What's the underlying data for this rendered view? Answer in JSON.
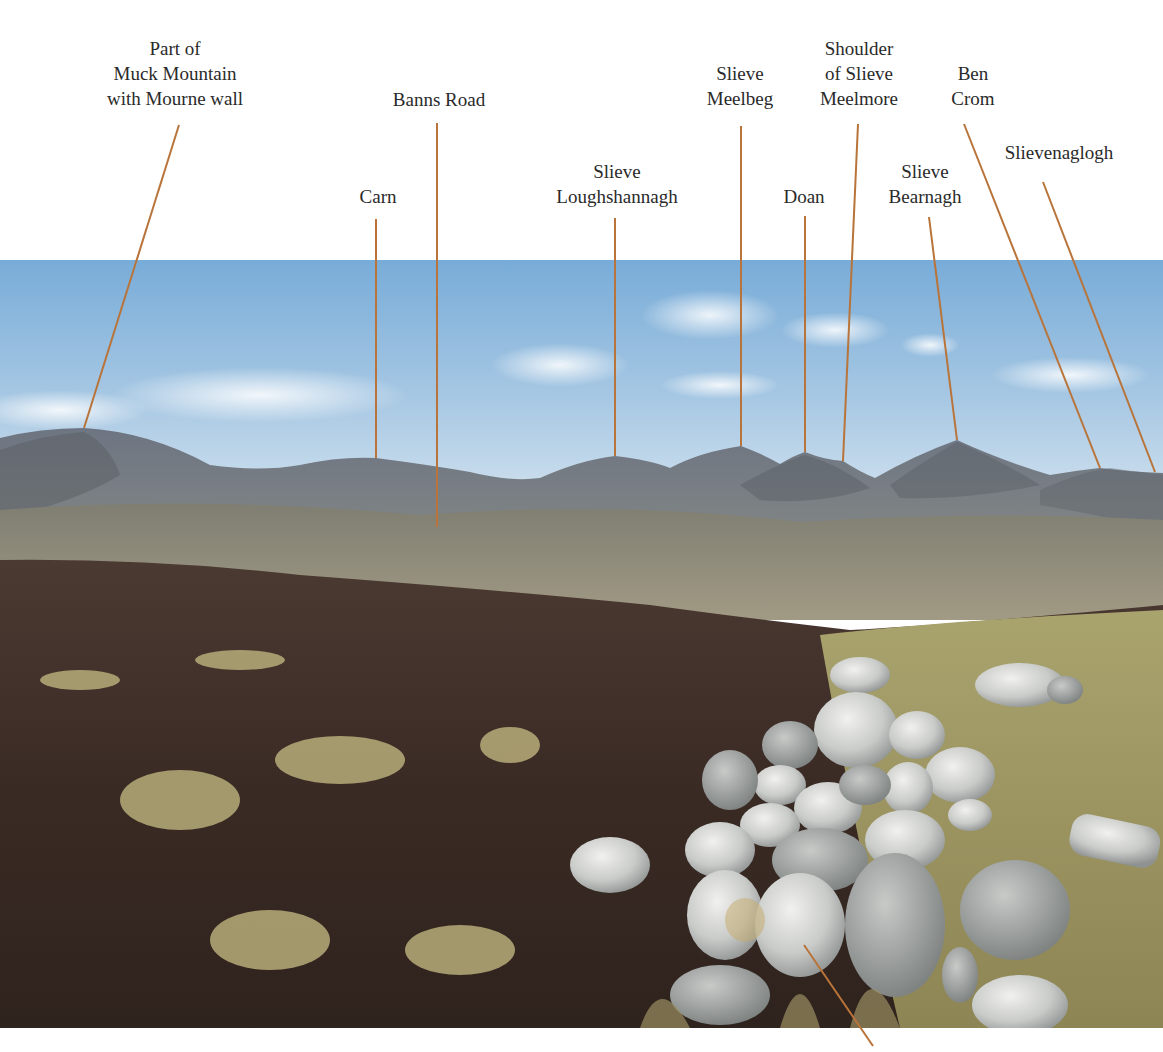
{
  "figure": {
    "leader_color": "#b8743a",
    "labels": [
      {
        "id": "muck",
        "text": "Part of\nMuck Mountain\nwith Mourne wall",
        "x": 175,
        "y": 36,
        "line": [
          [
            179,
            125
          ],
          [
            84,
            428
          ]
        ]
      },
      {
        "id": "banns",
        "text": "Banns Road",
        "x": 439,
        "y": 87,
        "line": [
          [
            437,
            123
          ],
          [
            437,
            527
          ]
        ]
      },
      {
        "id": "carn",
        "text": "Carn",
        "x": 378,
        "y": 184,
        "line": [
          [
            376,
            219
          ],
          [
            376,
            458
          ]
        ]
      },
      {
        "id": "loughshannagh",
        "text": "Slieve\nLoughshannagh",
        "x": 617,
        "y": 159,
        "line": [
          [
            615,
            218
          ],
          [
            615,
            456
          ]
        ]
      },
      {
        "id": "meelbeg",
        "text": "Slieve\nMeelbeg",
        "x": 740,
        "y": 61,
        "line": [
          [
            741,
            126
          ],
          [
            741,
            446
          ]
        ]
      },
      {
        "id": "doan",
        "text": "Doan",
        "x": 804,
        "y": 184,
        "line": [
          [
            805,
            216
          ],
          [
            805,
            452
          ]
        ]
      },
      {
        "id": "meelmore",
        "text": "Shoulder\nof Slieve\nMeelmore",
        "x": 859,
        "y": 36,
        "line": [
          [
            858,
            124
          ],
          [
            843,
            461
          ]
        ]
      },
      {
        "id": "bearnagh",
        "text": "Slieve\nBearnagh",
        "x": 925,
        "y": 159,
        "line": [
          [
            929,
            217
          ],
          [
            957,
            440
          ]
        ]
      },
      {
        "id": "bencrom",
        "text": "Ben\nCrom",
        "x": 973,
        "y": 61,
        "line": [
          [
            964,
            124
          ],
          [
            1100,
            468
          ]
        ]
      },
      {
        "id": "slievenaglogh",
        "text": "Slievenaglogh",
        "x": 1059,
        "y": 140,
        "line": [
          [
            1043,
            182
          ],
          [
            1155,
            472
          ]
        ]
      }
    ],
    "cairn_leader": {
      "line": [
        [
          804,
          945
        ],
        [
          873,
          1046
        ]
      ]
    }
  }
}
